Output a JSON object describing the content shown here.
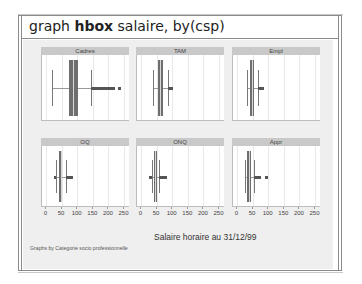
{
  "window": {
    "command_prefix": "graph ",
    "command_bold": "hbox",
    "command_suffix": " salaire, by(csp)"
  },
  "chart_data": {
    "type": "boxplot-horizontal",
    "title": "",
    "xlabel": "Salaire horaire au 31/12/99",
    "note": "Graphs by Categorie socio professionnelle",
    "x_ticks": [
      0,
      50,
      100,
      150,
      200,
      250
    ],
    "xlim": [
      0,
      260
    ],
    "grid": true,
    "layout": {
      "rows": 2,
      "cols": 3
    },
    "panels": [
      {
        "label": "Cadres",
        "whisker_low": 20,
        "q1": 73,
        "median": 88,
        "q3": 102,
        "whisker_high": 145,
        "outliers_range": [
          145,
          220
        ],
        "extra_outliers": [
          232
        ]
      },
      {
        "label": "TAM",
        "whisker_low": 40,
        "q1": 55,
        "median": 61,
        "q3": 70,
        "whisker_high": 88,
        "outliers_range": [
          88,
          102
        ],
        "extra_outliers": []
      },
      {
        "label": "Empl",
        "whisker_low": 32,
        "q1": 43,
        "median": 47,
        "q3": 54,
        "whisker_high": 68,
        "outliers_range": [
          68,
          85
        ],
        "extra_outliers": []
      },
      {
        "label": "OQ",
        "whisker_low": 33,
        "q1": 43,
        "median": 47,
        "q3": 52,
        "whisker_high": 64,
        "outliers_range": [
          64,
          88
        ],
        "extra_outliers": [],
        "low_outliers_range": [
          25,
          33
        ]
      },
      {
        "label": "ONQ",
        "whisker_low": 34,
        "q1": 42,
        "median": 46,
        "q3": 50,
        "whisker_high": 59,
        "outliers_range": [
          59,
          82
        ],
        "extra_outliers": [],
        "low_outliers_range": [
          25,
          34
        ]
      },
      {
        "label": "Appr",
        "whisker_low": 25,
        "q1": 33,
        "median": 38,
        "q3": 45,
        "whisker_high": 55,
        "outliers_range": [
          55,
          78
        ],
        "extra_outliers": [
          90
        ]
      }
    ]
  },
  "axis_labels": [
    "0",
    "50",
    "100",
    "150",
    "200",
    "250"
  ]
}
